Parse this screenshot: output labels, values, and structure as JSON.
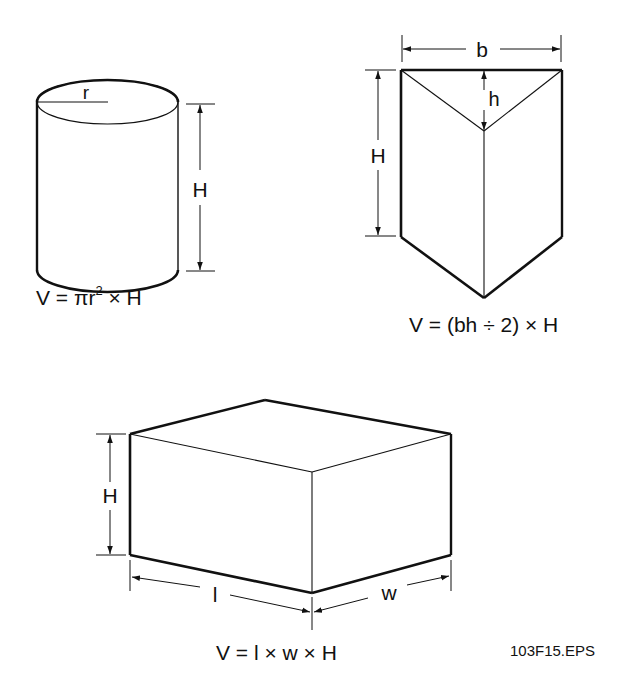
{
  "figure_id": "103F15.EPS",
  "shapes": {
    "cylinder": {
      "labels": {
        "radius": "r",
        "height": "H"
      },
      "formula": {
        "prefix": "V = πr",
        "exponent": "2",
        "suffix": " × H"
      }
    },
    "triangular_prism": {
      "labels": {
        "base": "b",
        "triangle_height": "h",
        "height": "H"
      },
      "formula": "V = (bh ÷ 2) × H"
    },
    "rectangular_box": {
      "labels": {
        "length": "l",
        "width": "w",
        "height": "H"
      },
      "formula": "V = l × w × H"
    }
  },
  "colors": {
    "line": "#111111",
    "background": "#ffffff"
  }
}
